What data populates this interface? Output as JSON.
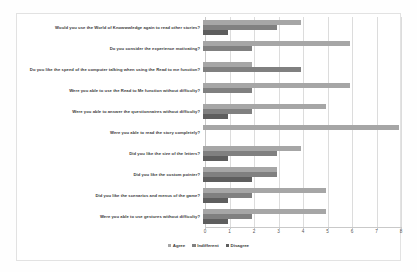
{
  "chart_data": {
    "type": "bar",
    "orientation": "horizontal",
    "title": "",
    "xlabel": "",
    "ylabel": "",
    "xlim": [
      0,
      8
    ],
    "xticks": [
      0,
      1,
      2,
      3,
      4,
      5,
      6,
      7,
      8
    ],
    "grid": true,
    "legend_position": "bottom",
    "categories": [
      "Would you use the World of Knowwwledge again to read other stories?",
      "Do you consider the experience motivating?",
      "Do you like the speed of the computer talking when using the Read to me function?",
      "Were you able to use the Read to Me function without difficulty?",
      "Were you able to answer the questionnaires without difficulty?",
      "Were you able to read the story completely?",
      "Did you like the size of the letters?",
      "Did you like the custom pointer?",
      "Did you like the scenarios and menus of the game?",
      "Were you able to use gestures without difficulty?"
    ],
    "series": [
      {
        "name": "Agree",
        "color": "#a6a6a6",
        "values": [
          4,
          6,
          2,
          6,
          5,
          8,
          4,
          3,
          5,
          5
        ]
      },
      {
        "name": "Indifferent",
        "color": "#808080",
        "values": [
          3,
          2,
          4,
          2,
          2,
          0,
          3,
          3,
          2,
          2
        ]
      },
      {
        "name": "Disagree",
        "color": "#5e5e5e",
        "values": [
          1,
          0,
          0,
          0,
          1,
          0,
          1,
          2,
          1,
          1
        ]
      }
    ]
  },
  "legend": {
    "items": [
      {
        "label": "Agree",
        "color": "#a6a6a6"
      },
      {
        "label": "Indifferent",
        "color": "#808080"
      },
      {
        "label": "Disagree",
        "color": "#5e5e5e"
      }
    ]
  }
}
